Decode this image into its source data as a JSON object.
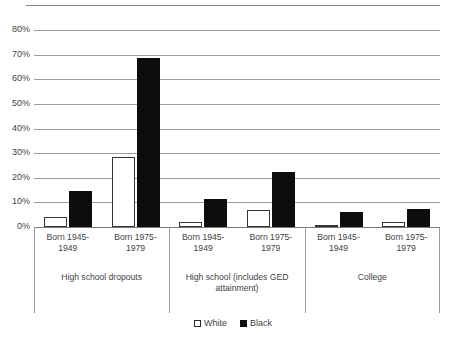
{
  "chart_data": {
    "type": "bar",
    "title": "",
    "xlabel": "",
    "ylabel": "",
    "ylim": [
      0,
      80
    ],
    "y_tick_labels": [
      "80%",
      "70%",
      "60%",
      "50%",
      "40%",
      "30%",
      "20%",
      "10%",
      "0%"
    ],
    "y_tick_values": [
      80,
      70,
      60,
      50,
      40,
      30,
      20,
      10,
      0
    ],
    "grid": true,
    "legend_position": "bottom-center",
    "groups": [
      {
        "label": "High school dropouts",
        "categories": [
          "Born 1945-1949",
          "Born 1975-1979"
        ]
      },
      {
        "label": "High school (includes GED attainment)",
        "categories": [
          "Born 1945-1949",
          "Born 1975-1979"
        ]
      },
      {
        "label": "College",
        "categories": [
          "Born 1945-1949",
          "Born 1975-1979"
        ]
      }
    ],
    "categories": [
      "High school dropouts / Born 1945-1949",
      "High school dropouts / Born 1975-1979",
      "High school (includes GED attainment) / Born 1945-1949",
      "High school (includes GED attainment) / Born 1975-1979",
      "College / Born 1945-1949",
      "College / Born 1975-1979"
    ],
    "series": [
      {
        "name": "White",
        "color": "#ffffff",
        "values": [
          4.0,
          28.5,
          2.0,
          7.0,
          1.0,
          2.0
        ]
      },
      {
        "name": "Black",
        "color": "#0d0d0d",
        "values": [
          14.8,
          68.5,
          11.5,
          22.2,
          6.0,
          7.5
        ]
      }
    ]
  },
  "legend": {
    "items": [
      {
        "label": "White",
        "swatch": "white-square-outline"
      },
      {
        "label": "Black",
        "swatch": "black-square-filled"
      }
    ]
  }
}
